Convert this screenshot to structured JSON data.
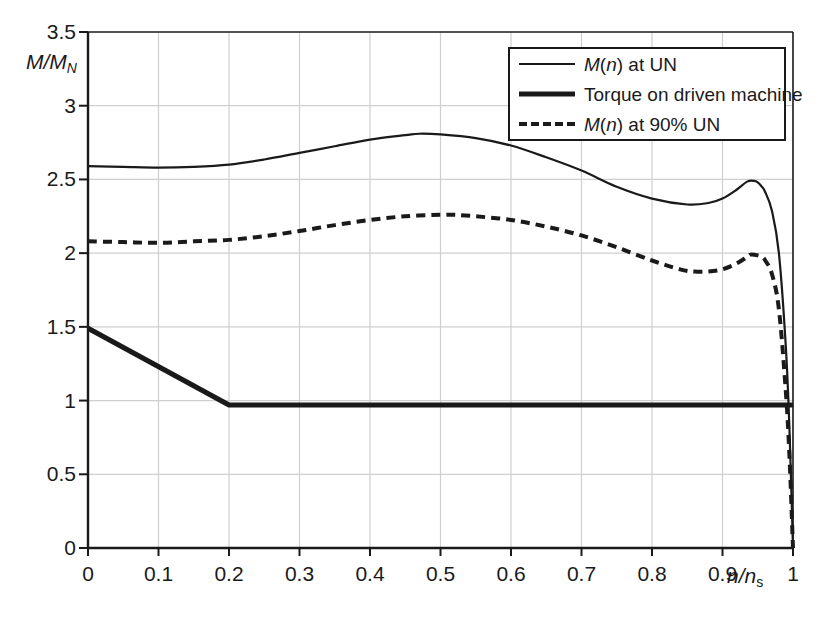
{
  "chart_data": {
    "type": "line",
    "title": "",
    "xlabel": "n/n_s",
    "ylabel": "M/M_N",
    "xlim": [
      0,
      1
    ],
    "ylim": [
      0,
      3.5
    ],
    "grid": true,
    "legend_position": "top-right",
    "xticks": [
      "0",
      "0.1",
      "0.2",
      "0.3",
      "0.4",
      "0.5",
      "0.6",
      "0.7",
      "0.8",
      "0.9",
      "1"
    ],
    "xtick_values": [
      0,
      0.1,
      0.2,
      0.3,
      0.4,
      0.5,
      0.6,
      0.7,
      0.8,
      0.9,
      1
    ],
    "yticks": [
      "0",
      "0.5",
      "1",
      "1.5",
      "2",
      "2.5",
      "3",
      "3.5"
    ],
    "ytick_values": [
      0,
      0.5,
      1,
      1.5,
      2,
      2.5,
      3,
      3.5
    ],
    "series": [
      {
        "name": "M(n) at UN",
        "style": "thin-solid",
        "color": "#1a1a1a",
        "x": [
          0.0,
          0.05,
          0.1,
          0.15,
          0.2,
          0.25,
          0.3,
          0.35,
          0.4,
          0.45,
          0.47,
          0.5,
          0.55,
          0.6,
          0.65,
          0.7,
          0.75,
          0.8,
          0.85,
          0.88,
          0.9,
          0.92,
          0.935,
          0.945,
          0.95,
          0.955,
          0.96,
          0.97,
          0.98,
          0.99,
          0.995,
          1.0
        ],
        "values": [
          2.59,
          2.585,
          2.58,
          2.585,
          2.6,
          2.635,
          2.68,
          2.725,
          2.77,
          2.8,
          2.81,
          2.805,
          2.78,
          2.73,
          2.65,
          2.56,
          2.45,
          2.37,
          2.33,
          2.34,
          2.37,
          2.43,
          2.485,
          2.49,
          2.48,
          2.455,
          2.42,
          2.29,
          2.0,
          1.35,
          0.8,
          0.0
        ]
      },
      {
        "name": "Torque on driven machine",
        "style": "thick-solid",
        "color": "#1a1a1a",
        "x": [
          0.0,
          0.2,
          1.0
        ],
        "values": [
          1.49,
          0.97,
          0.97
        ]
      },
      {
        "name": "M(n) at 90% UN",
        "style": "dashed",
        "color": "#1a1a1a",
        "x": [
          0.0,
          0.05,
          0.1,
          0.15,
          0.2,
          0.25,
          0.3,
          0.35,
          0.4,
          0.45,
          0.5,
          0.52,
          0.55,
          0.6,
          0.65,
          0.7,
          0.75,
          0.8,
          0.84,
          0.86,
          0.88,
          0.9,
          0.92,
          0.935,
          0.94,
          0.95,
          0.955,
          0.96,
          0.97,
          0.98,
          0.99,
          0.995,
          1.0
        ],
        "values": [
          2.08,
          2.075,
          2.07,
          2.08,
          2.09,
          2.115,
          2.15,
          2.19,
          2.225,
          2.25,
          2.26,
          2.26,
          2.25,
          2.225,
          2.18,
          2.12,
          2.04,
          1.95,
          1.89,
          1.875,
          1.875,
          1.89,
          1.93,
          1.975,
          1.99,
          1.985,
          1.975,
          1.955,
          1.86,
          1.62,
          1.05,
          0.62,
          0.0
        ]
      }
    ]
  },
  "legend": {
    "items": [
      {
        "label_html": "<i>M</i>(<i>n</i>) at UN",
        "swatch": "thin-solid"
      },
      {
        "label_html": "Torque on driven machine",
        "swatch": "thick-solid"
      },
      {
        "label_html": "<i>M</i>(<i>n</i>) at 90% UN",
        "swatch": "dashed"
      }
    ]
  },
  "axis_labels": {
    "y_main": "M/M",
    "y_sub": "N",
    "x_main": "n/n",
    "x_sub": "s"
  },
  "colors": {
    "line": "#1a1a1a",
    "grid": "#cfcfcf",
    "axis": "#1a1a1a",
    "background": "#ffffff"
  }
}
